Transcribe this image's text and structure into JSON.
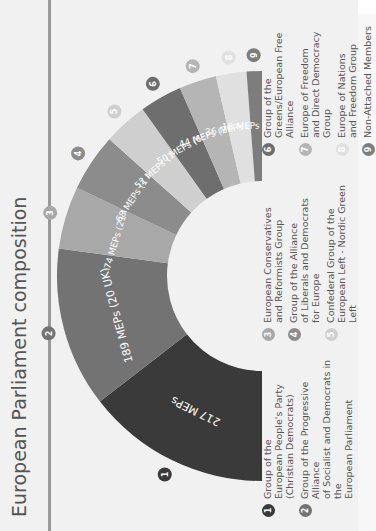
{
  "header": {
    "title": "European Parliament composition"
  },
  "chart_data": {
    "type": "pie",
    "subtype": "half-donut",
    "title": "European Parliament composition",
    "categories": [
      "Group of the European People's Party (Christian Democrats)",
      "Group of the Progressive Alliance of Socialist and Democrats in the European Parliament",
      "European Conservatives and Reformists Group",
      "Group of the Alliance of Liberals and Democrats for Europe",
      "Confederal Group of the European Left - Nordic Green Left",
      "Group of the Greens/European Free Alliance",
      "Europe of Freedom and Direct Democracy Group",
      "Europe of Nations and Freedom Group",
      "Non-Attached Members"
    ],
    "values": [
      217,
      189,
      74,
      68,
      52,
      50,
      44,
      36,
      18
    ],
    "uk_values": [
      0,
      20,
      21,
      1,
      1,
      6,
      20,
      1,
      3
    ],
    "segment_labels": [
      "217 MEPs",
      "189 MEPs (20 UK)",
      "74 MEPs (21 UK)",
      "68 MEPs (1 UK)",
      "52 MEPs (1 UK)",
      "50 MEPs (6 UK)",
      "44 MEPs (20 UK)",
      "36 MEPs (1 UK)",
      "18 MEPs (3 UK)"
    ],
    "colors": [
      "#3a3a3a",
      "#737373",
      "#a8a8a8",
      "#8c8c8c",
      "#cfcfcf",
      "#6e6e6e",
      "#b5b5b5",
      "#e0e0e0",
      "#7d7d7d"
    ]
  },
  "legend": {
    "items": [
      {
        "num": "1",
        "label": "Group of the\nEuropean People's Party\n(Christian Democrats)"
      },
      {
        "num": "2",
        "label": "Group of the Progressive Alliance\nof Socialist and Democrats in the\nEuropean Parliament"
      },
      {
        "num": "3",
        "label": "European Conservatives\nand Reformists Group"
      },
      {
        "num": "4",
        "label": "Group of the Alliance\nof Liberals and Democrats\nfor Europe"
      },
      {
        "num": "5",
        "label": "Confederal Group of the\nEuropean Left - Nordic Green Left"
      },
      {
        "num": "6",
        "label": "Group of the\nGreens/European Free Alliance"
      },
      {
        "num": "7",
        "label": "Europe of Freedom\nand Direct Democracy Group"
      },
      {
        "num": "8",
        "label": "Europe of Nations\nand Freedom Group"
      },
      {
        "num": "9",
        "label": "Non-Attached Members"
      }
    ]
  }
}
